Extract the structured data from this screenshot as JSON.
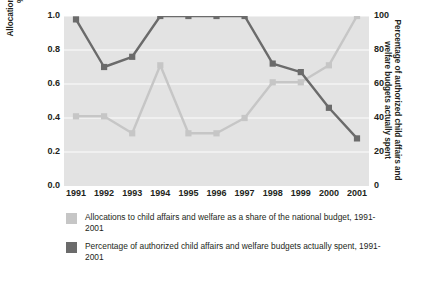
{
  "chart_data": {
    "type": "line",
    "title": "",
    "subtitle": "",
    "xlabel": "",
    "grid": true,
    "legend_position": "bottom-left",
    "categories": [
      "1991",
      "1992",
      "1993",
      "1994",
      "1995",
      "1996",
      "1997",
      "1998",
      "1999",
      "2000",
      "2001"
    ],
    "x_tick_labels": [
      "1991",
      "1992",
      "1993",
      "1994",
      "1995",
      "1996",
      "1997",
      "1998",
      "1999",
      "2000",
      "2001"
    ],
    "axes": {
      "left": {
        "label": "Allocation of child affairs and welfare as a % of the national budget",
        "ylim": [
          0.0,
          1.0
        ],
        "ticks": [
          0.0,
          0.2,
          0.4,
          0.6,
          0.8,
          1.0
        ],
        "tick_labels": [
          "0.0",
          "0.2",
          "0.4",
          "0.6",
          "0.8",
          "1.0"
        ]
      },
      "right": {
        "label": "Percentage of authorized child affairs and welfare budgets actually spent",
        "ylim": [
          0,
          100
        ],
        "ticks": [
          0,
          20,
          40,
          60,
          80,
          100
        ],
        "tick_labels": [
          "0",
          "20",
          "40",
          "60",
          "80",
          "100"
        ]
      }
    },
    "series": [
      {
        "name": "Allocations to child affairs and welfare as a share of the national budget, 1991-2001",
        "axis": "left",
        "color": "#c6c6c6",
        "marker": "square",
        "values": [
          0.41,
          0.41,
          0.31,
          0.71,
          0.31,
          0.31,
          0.4,
          0.61,
          0.61,
          0.71,
          1.0
        ]
      },
      {
        "name": "Percentage of authorized child affairs and welfare budgets actually spent, 1991-2001",
        "axis": "right",
        "color": "#6b6b6b",
        "marker": "square",
        "values": [
          98,
          70,
          76,
          100,
          100,
          100,
          100,
          72,
          67,
          46,
          28
        ]
      }
    ]
  },
  "legend": {
    "items": [
      {
        "label": "Allocations to child affairs and welfare as a share of the national budget, 1991-2001",
        "color": "#c6c6c6"
      },
      {
        "label": "Percentage of authorized child affairs and welfare budgets actually spent, 1991-2001",
        "color": "#6b6b6b"
      }
    ]
  },
  "colors": {
    "plot_background": "#e3e3e3",
    "gridline": "#f4f4f4",
    "text": "#231f20",
    "series_light": "#c6c6c6",
    "series_dark": "#6b6b6b"
  }
}
